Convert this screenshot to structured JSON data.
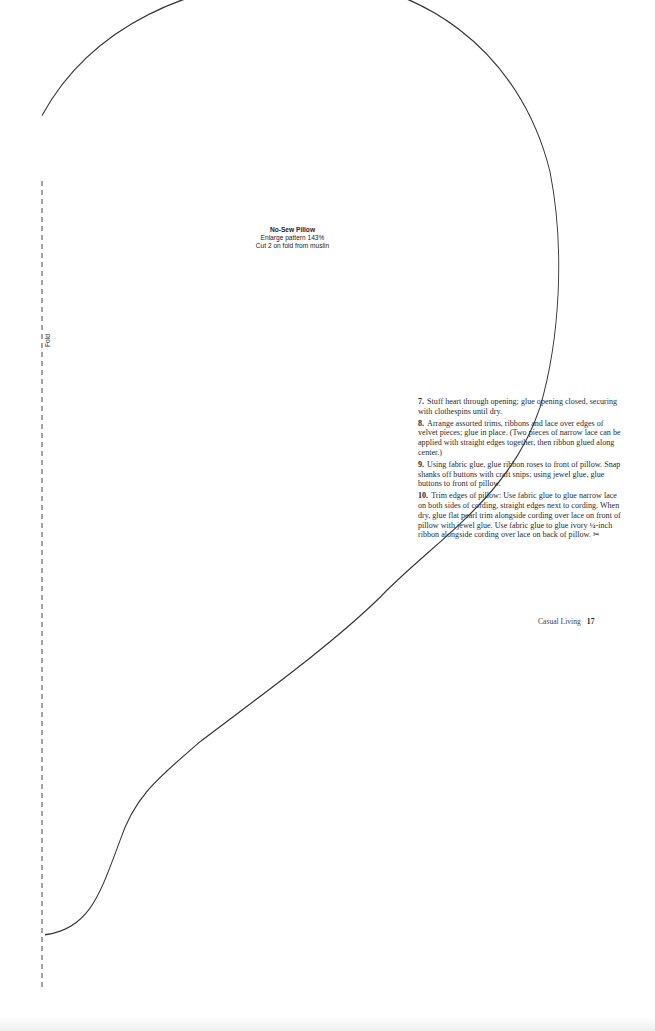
{
  "pattern": {
    "title": "No-Sew Pillow",
    "enlarge_note": "Enlarge pattern 143%",
    "cut_note": "Cut 2 on fold from muslin",
    "fold_label": "Fold",
    "outline_color": "#333333"
  },
  "instructions": {
    "steps": [
      {
        "number": "7.",
        "text": "Stuff heart through opening; glue opening closed, securing with clothespins until dry."
      },
      {
        "number": "8.",
        "text": "Arrange assorted trims, ribbons and lace over edges of velvet pieces; glue in place. (Two pieces of narrow lace can be applied with straight edges together, then ribbon glued along center.)"
      },
      {
        "number": "9.",
        "text": "Using fabric glue, glue ribbon roses to front of pillow. Snap shanks off buttons with craft snips; using jewel glue, glue buttons to front of pillow."
      },
      {
        "number": "10.",
        "text": "Trim edges of pillow: Use fabric glue to glue narrow lace on both sides of cording, straight edges next to cording. When dry, glue flat pearl trim alongside cording over lace on front of pillow with jewel glue. Use fabric glue to glue ivory ¼-inch ribbon alongside cording over lace on back of pillow."
      }
    ],
    "end_mark_icon": "scissors-icon",
    "end_mark_glyph": "✂"
  },
  "footer": {
    "section": "Casual Living",
    "page_number": "17"
  }
}
